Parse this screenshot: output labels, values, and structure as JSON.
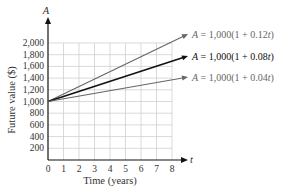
{
  "chart_data": {
    "type": "line",
    "title": "",
    "xlabel": "Time (years)",
    "ylabel": "Future value ($)",
    "x_axis_symbol": "t",
    "y_axis_symbol": "A",
    "xlim": [
      0,
      8
    ],
    "ylim": [
      0,
      2000
    ],
    "x_ticks": [
      "0",
      "1",
      "2",
      "3",
      "4",
      "5",
      "6",
      "7",
      "8"
    ],
    "y_ticks": [
      "200",
      "400",
      "600",
      "800",
      "1,000",
      "1,200",
      "1,400",
      "1,600",
      "1,800",
      "2,000"
    ],
    "grid": true,
    "x": [
      0,
      9
    ],
    "series": [
      {
        "name": "A = 1,000(1 + 0.12t)",
        "rate": 0.12,
        "values": [
          1000,
          2080
        ],
        "color": "#666666",
        "emphasis": false
      },
      {
        "name": "A = 1,000(1 + 0.08t)",
        "rate": 0.08,
        "values": [
          1000,
          1720
        ],
        "color": "#111111",
        "emphasis": true
      },
      {
        "name": "A = 1,000(1 + 0.04t)",
        "rate": 0.04,
        "values": [
          1000,
          1360
        ],
        "color": "#666666",
        "emphasis": false
      }
    ],
    "legend_position": "inline-right"
  },
  "labels": {
    "eq1_prefix": "A",
    "eq1_body": " = 1,000(1 + 0.12",
    "eq1_t": "t",
    "eq1_close": ")",
    "eq2_prefix": "A",
    "eq2_body": " = 1,000(1 + 0.08",
    "eq2_t": "t",
    "eq2_close": ")",
    "eq3_prefix": "A",
    "eq3_body": " = 1,000(1 + 0.04",
    "eq3_t": "t",
    "eq3_close": ")"
  }
}
